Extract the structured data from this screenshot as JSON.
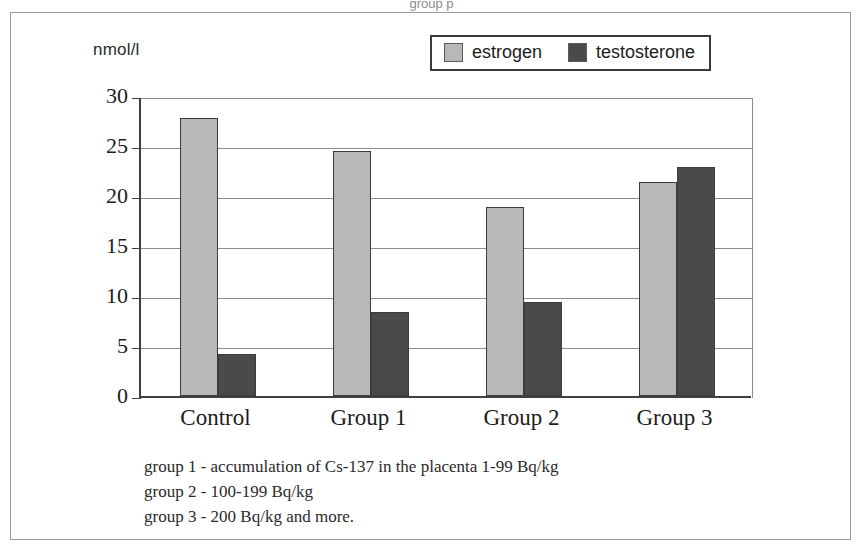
{
  "top_caption": "group p",
  "axis_unit_label": "nmol/l",
  "legend": {
    "position": "top-center",
    "items": [
      {
        "label": "estrogen",
        "color": "#b8b8b8"
      },
      {
        "label": "testosterone",
        "color": "#4a4a4a"
      }
    ]
  },
  "footnotes": [
    "group 1 - accumulation of Cs-137 in the placenta 1-99 Bq/kg",
    "group 2 - 100-199 Bq/kg",
    "group 3 - 200 Bq/kg and more."
  ],
  "chart_data": {
    "type": "bar",
    "title": "",
    "xlabel": "",
    "ylabel": "nmol/l",
    "categories": [
      "Control",
      "Group 1",
      "Group 2",
      "Group 3"
    ],
    "series": [
      {
        "name": "estrogen",
        "color": "#b8b8b8",
        "values": [
          27.8,
          24.5,
          18.9,
          21.4
        ]
      },
      {
        "name": "testosterone",
        "color": "#4a4a4a",
        "values": [
          4.2,
          8.4,
          9.4,
          22.9
        ]
      }
    ],
    "ylim": [
      0,
      30
    ],
    "yticks": [
      0,
      5,
      10,
      15,
      20,
      25,
      30
    ],
    "ytick_labels": [
      "0",
      "5",
      "10",
      "15",
      "20",
      "25",
      "30"
    ],
    "grid": true,
    "legend_position": "top-center"
  }
}
